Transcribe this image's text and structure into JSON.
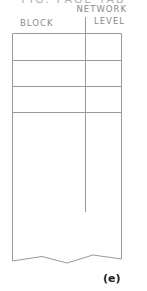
{
  "diagram": {
    "top_cut_text": "FIG. PAGE TAB",
    "column_headers": {
      "block": "BLOCK",
      "network_line1": "NETWORK",
      "network_line2": "LEVEL"
    },
    "rows": 3,
    "figure_label": "(e)",
    "colors": {
      "line": "#9a9a9a",
      "text": "#8a8a8a",
      "label": "#222222"
    }
  }
}
